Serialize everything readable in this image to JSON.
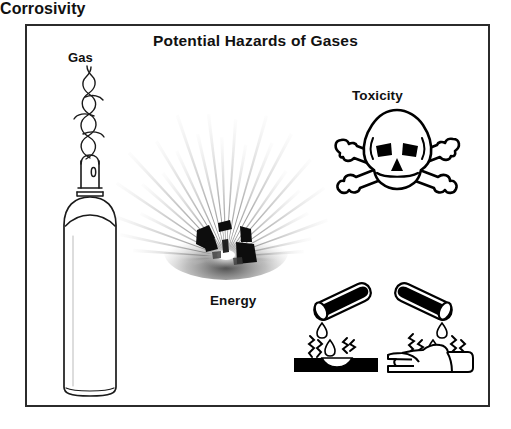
{
  "figure": {
    "title": "Potential Hazards of Gases",
    "background_color": "#ffffff",
    "border_color": "#2b2b2b",
    "ink_color": "#111111"
  },
  "labels": {
    "gas": "Gas",
    "energy": "Energy",
    "toxicity": "Toxicity",
    "corrosivity": "Corrosivity"
  },
  "illustrations": {
    "gas_cylinder": "gas-cylinder-icon",
    "gas_plume": "swirling-gas-icon",
    "explosion_burst": "explosion-burst-icon",
    "skull_and_crossbones": "skull-and-crossbones-icon",
    "corrosion_test_tube_surface": "test-tube-on-surface-icon",
    "corrosion_test_tube_hand": "test-tube-on-hand-icon"
  }
}
